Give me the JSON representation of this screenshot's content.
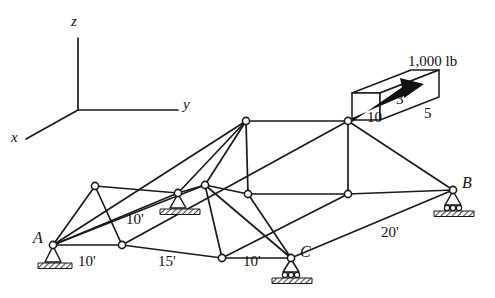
{
  "figure": {
    "type": "engineering-diagram",
    "width": 495,
    "height": 298,
    "line_color": "#1a1a1a",
    "node_fill": "#ffffff",
    "hatch_color": "#555555"
  },
  "axes": {
    "origin": {
      "x": 78,
      "y": 110
    },
    "z": {
      "label": "z",
      "tip": {
        "x": 78,
        "y": 38
      },
      "label_pos": {
        "x": 71,
        "y": 16
      }
    },
    "y": {
      "label": "y",
      "tip": {
        "x": 178,
        "y": 110
      },
      "label_pos": {
        "x": 183,
        "y": 98
      }
    },
    "x": {
      "label": "x",
      "tip": {
        "x": 26,
        "y": 139
      },
      "label_pos": {
        "x": 11,
        "y": 133
      }
    }
  },
  "nodes": [
    {
      "id": "A",
      "label": "A",
      "x": 53,
      "y": 245,
      "label_pos": {
        "x": 34,
        "y": 232
      }
    },
    {
      "id": "B",
      "label": "B",
      "x": 453,
      "y": 190,
      "label_pos": {
        "x": 462,
        "y": 176
      }
    },
    {
      "id": "C",
      "label": "C",
      "x": 291,
      "y": 258,
      "label_pos": {
        "x": 300,
        "y": 245
      }
    },
    {
      "id": "D",
      "label": "",
      "x": 95,
      "y": 186,
      "label_pos": null
    },
    {
      "id": "E",
      "label": "",
      "x": 122,
      "y": 245,
      "label_pos": null
    },
    {
      "id": "F",
      "label": "",
      "x": 178,
      "y": 193,
      "label_pos": null
    },
    {
      "id": "G",
      "label": "",
      "x": 205,
      "y": 185,
      "label_pos": null
    },
    {
      "id": "H",
      "label": "",
      "x": 222,
      "y": 258,
      "label_pos": null
    },
    {
      "id": "I",
      "label": "",
      "x": 246,
      "y": 121,
      "label_pos": null
    },
    {
      "id": "J",
      "label": "",
      "x": 248,
      "y": 194,
      "label_pos": null
    },
    {
      "id": "K",
      "label": "",
      "x": 348,
      "y": 121,
      "label_pos": null
    },
    {
      "id": "L",
      "label": "",
      "x": 348,
      "y": 194,
      "label_pos": null
    }
  ],
  "supports": [
    {
      "id": "support-a",
      "type": "pin",
      "node": "A",
      "x": 53,
      "y": 245
    },
    {
      "id": "support-f",
      "type": "pin",
      "node": "F",
      "x": 178,
      "y": 193
    },
    {
      "id": "support-b",
      "type": "roller",
      "node": "B",
      "x": 453,
      "y": 190
    },
    {
      "id": "support-c",
      "type": "roller",
      "node": "C",
      "x": 291,
      "y": 258
    }
  ],
  "dimensions": [
    {
      "id": "dim-bottom-1",
      "text": "10'",
      "x": 78,
      "y": 262
    },
    {
      "id": "dim-bottom-2",
      "text": "15'",
      "x": 158,
      "y": 262
    },
    {
      "id": "dim-bottom-3",
      "text": "10'",
      "x": 243,
      "y": 262
    },
    {
      "id": "dim-height",
      "text": "10'",
      "x": 126,
      "y": 219
    },
    {
      "id": "dim-right",
      "text": "20'",
      "x": 381,
      "y": 232
    }
  ],
  "load": {
    "id": "load-1000lb",
    "label": "1,000 lb",
    "label_pos": {
      "x": 408,
      "y": 56
    },
    "start": {
      "x": 349,
      "y": 121
    },
    "end": {
      "x": 424,
      "y": 84
    },
    "slope_box": {
      "numbers": [
        {
          "id": "slope-vertical",
          "text": "3",
          "x": 398,
          "y": 99
        },
        {
          "id": "slope-horizontal",
          "text": "10",
          "x": 372,
          "y": 116
        },
        {
          "id": "slope-depth",
          "text": "5",
          "x": 425,
          "y": 113
        }
      ]
    }
  }
}
